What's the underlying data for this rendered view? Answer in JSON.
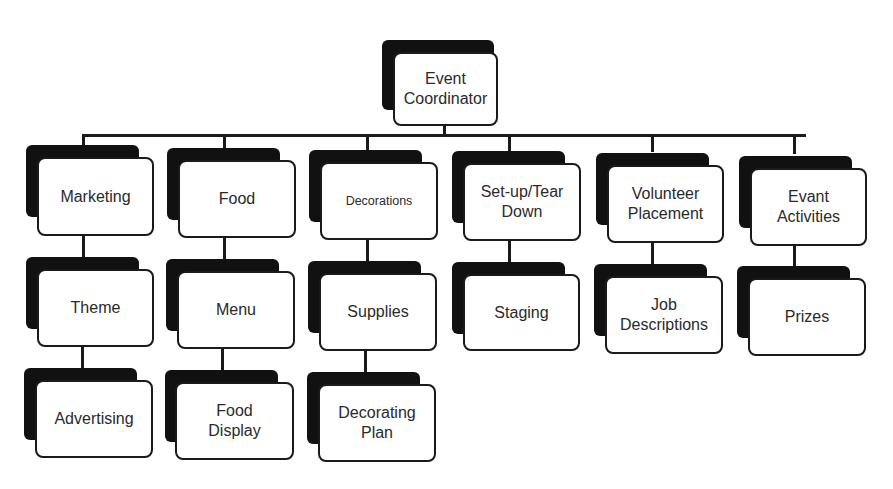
{
  "diagram": {
    "type": "org-chart",
    "root": {
      "label": "Event Coordinator",
      "lines": [
        "Event",
        "Coordinator"
      ]
    },
    "columns": [
      {
        "label": "Marketing",
        "children": [
          "Theme",
          "Advertising"
        ]
      },
      {
        "label": "Food",
        "children": [
          "Menu",
          "Food Display"
        ]
      },
      {
        "label": "Decorations",
        "children": [
          "Supplies",
          "Decorating Plan"
        ]
      },
      {
        "label": "Set-up/Tear Down",
        "children": [
          "Staging"
        ]
      },
      {
        "label": "Volunteer Placement",
        "children": [
          "Job Descriptions"
        ]
      },
      {
        "label": "Evant Activities",
        "children": [
          "Prizes"
        ]
      }
    ]
  },
  "nodes": {
    "root": "Event\nCoordinator",
    "marketing": "Marketing",
    "food": "Food",
    "decorations": "Decorations",
    "setup": "Set-up/Tear\nDown",
    "volunteer": "Volunteer\nPlacement",
    "activities": "Evant\nActivities",
    "theme": "Theme",
    "menu": "Menu",
    "supplies": "Supplies",
    "staging": "Staging",
    "job": "Job\nDescriptions",
    "prizes": "Prizes",
    "advertising": "Advertising",
    "food_display": "Food\nDisplay",
    "decorating_plan": "Decorating\nPlan"
  },
  "colors": {
    "shadow": "#111111",
    "border": "#1a1a1a",
    "text": "#2a2a2a",
    "background": "#ffffff"
  }
}
